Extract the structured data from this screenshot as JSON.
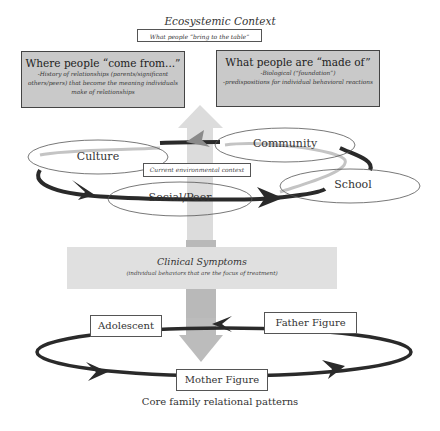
{
  "ecosystemic": {
    "title": "Ecosystemic Context",
    "subtitle": "What people “bring to the table”"
  },
  "left_box": {
    "title": "Where people “come from...”",
    "body": "-History of relationships (parents/significant others/peers) that become the meaning individuals make of relationships"
  },
  "right_box": {
    "title": "What people are “made of”",
    "line1": "-Biological (“foundation”)",
    "line2": "-predispositions for individual behavioral reactions"
  },
  "environment": {
    "ellipses": [
      {
        "label": "Culture"
      },
      {
        "label": "Community"
      },
      {
        "label": "Social/Peer"
      },
      {
        "label": "School"
      }
    ],
    "context_label": "Current environmental context"
  },
  "clinical": {
    "title": "Clinical Symptoms",
    "subtitle": "(individual behaviors that are the focus of treatment)"
  },
  "family": {
    "members": [
      {
        "label": "Adolescent"
      },
      {
        "label": "Father Figure"
      },
      {
        "label": "Mother Figure"
      }
    ],
    "caption": "Core family relational patterns"
  },
  "colors": {
    "box_fill": "#c9c9c9",
    "arrow_light": "#d6d6d6",
    "arrow_mid": "#b5b5b5",
    "ring_dark": "#2a2a2a",
    "ring_light": "#c4c4c4"
  }
}
